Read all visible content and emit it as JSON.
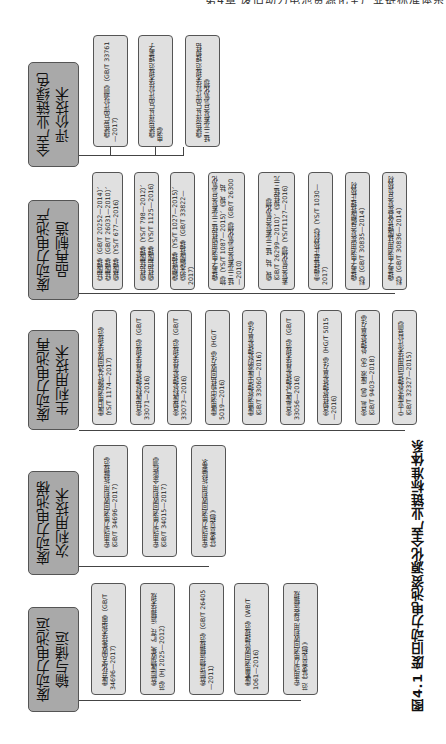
{
  "running_head": "第4章  废旧动力电池资源化全产业链标准体系",
  "caption": "图4.1  废旧动力电池资源化全产业链标准体系",
  "colors": {
    "category_fill": "#a9a9a9",
    "child_fill": "#e0e0e0",
    "border": "#555555",
    "line": "#444444"
  },
  "rows": [
    {
      "category": "全产业链绿色评价技术",
      "children": [
        "《绿色产品评价通则》（GB/T 33761—2017）",
        "《绿色设计产品评价技术规范 锂离子电池》",
        "《绿色设计产品评价技术规范 锂镍钴锰三元素复合氢氧化物》"
      ]
    },
    {
      "category": "废动力电池产品再制造",
      "children": [
        "《钴酸锂》（GB/T 20252—2014）、《锰酸锂》（GB/T 26031—2010）、《镍酸锂》（YS/T 677—2016）",
        "《镍钴锰酸锂》（YS/T 798—2012）、《镍钴铝酸锂》（YS/T 1125—2016）",
        "《磷酸铁锂》（YS/T 1027—2015）、《纳米磷酸铁锂》（GB/T 33822—2017）",
        "《锂离子电池用镍钴锰三元素复合氢氧化物》（YS/T 1087—2015）、《镍、钴、锰三元素复合氢氧化物》（GB/T 26300—2010）",
        "《镍、钴、锰三元素复合氧化物》（GB/T 26299—2010）、《镍钴锰三元素复合氧化物》（YS/T1127—2016）",
        "《富锂锰基正极材料》（YS/T 1030—2017）",
        "《锂离子电池用炭复合磷酸铁锂正极材料》（GB/T 30835—2014）",
        "《锂离子电池用钛酸锂及其炭复合负极材料》（GB/T 30836—2014）"
      ]
    },
    {
      "category": "废动力电池再生利用技术",
      "children": [
        "《废旧电池破碎分选回收技术规范》（YS/T 1174—2017）",
        "《含钴废料处理处置技术规范》（GB/T 33071—2016）",
        "《含镍废料处理处置技术规范》（GB/T 33073—2016）",
        "《废电池中镍钴回收方法》（HG/T 5019—2016）",
        "《废电池处理中废液的处理处置方法》（GB/T 33060—2016）",
        "《含氟废气处理处置技术规范》（GB/T 33056—2016）",
        "《含镍钴处理处置方法》（HG/T 5015—2016）",
        "《含氟（氯）废液（水）处理处置方法》（GB/T 9403—2018）",
        "《工业废水处理与回用技术评价导则》（GB/T 32327—2015）"
      ]
    },
    {
      "category": "废动力电池梯次利用技术",
      "children": [
        "《车用动力电池回收利用 拆解规范》（GB/T 34696—2017）",
        "《车用动力电池回收利用 余能检测》（GB/T 34015—2017）",
        "《车用动力电池回收利用 拆除要求（征求意见稿）》"
      ]
    },
    {
      "category": "废动力电池运输与储运",
      "children": [
        "《废弃化学品收集技术指南》（GB/T 34696—2017）",
        "《危险废物收集、贮存、运输技术规范》（HJ 2025—2012）",
        "《危险货物运输规范》（GB/T 26405—2011）",
        "《废蓄电池回收管理规范》（WB/T 1061—2016）",
        "《车用动力电池回收利用 包装运输规范（征求意见稿）》"
      ]
    }
  ]
}
